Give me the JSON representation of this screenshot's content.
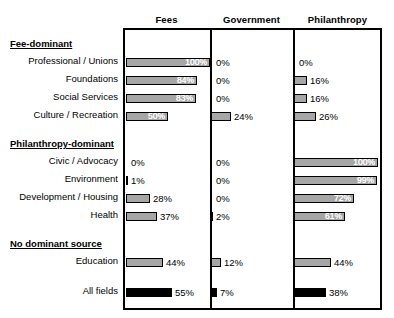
{
  "chart_data": {
    "type": "bar",
    "orientation": "horizontal",
    "title": "",
    "xlabel": "",
    "ylabel": "",
    "xlim": [
      0,
      100
    ],
    "grid": false,
    "legend": "none",
    "panels": [
      "Fees",
      "Government",
      "Philanthropy"
    ],
    "groups": [
      {
        "name": "Fee-dominant",
        "rows": [
          {
            "label": "Professional / Unions",
            "values": [
              100,
              0,
              0
            ]
          },
          {
            "label": "Foundations",
            "values": [
              84,
              0,
              16
            ]
          },
          {
            "label": "Social Services",
            "values": [
              83,
              0,
              16
            ]
          },
          {
            "label": "Culture / Recreation",
            "values": [
              50,
              24,
              26
            ]
          }
        ]
      },
      {
        "name": "Philanthropy-dominant",
        "rows": [
          {
            "label": "Civic / Advocacy",
            "values": [
              0,
              0,
              100
            ]
          },
          {
            "label": "Environment",
            "values": [
              1,
              0,
              99
            ]
          },
          {
            "label": "Development / Housing",
            "values": [
              28,
              0,
              72
            ]
          },
          {
            "label": "Health",
            "values": [
              37,
              2,
              61
            ]
          }
        ]
      },
      {
        "name": "No dominant source",
        "rows": [
          {
            "label": "Education",
            "values": [
              44,
              12,
              44
            ]
          }
        ]
      }
    ],
    "total_row": {
      "label": "All fields",
      "values": [
        55,
        7,
        38
      ]
    },
    "value_suffix": "%"
  },
  "style": {
    "bar_fill": "#a6a6a6",
    "bar_total_fill": "#000000",
    "bar_stroke": "#000000",
    "box_stroke": "#000000",
    "background": "#ffffff"
  },
  "headers": {
    "fees": "Fees",
    "government": "Government",
    "philanthropy": "Philanthropy"
  }
}
